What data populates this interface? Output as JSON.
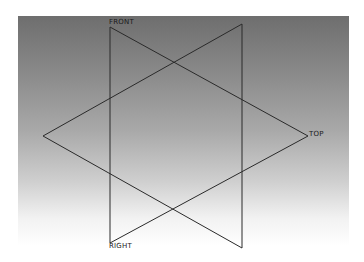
{
  "viewport": {
    "background_top": "#6e6e6e",
    "background_bottom": "#ffffff",
    "line_color": "#2a2a2a"
  },
  "datum_planes": [
    {
      "name": "FRONT",
      "label": "FRONT",
      "label_pos": [
        109,
        19
      ]
    },
    {
      "name": "TOP",
      "label": "TOP",
      "label_pos": [
        309,
        131
      ]
    },
    {
      "name": "RIGHT",
      "label": "RIGHT",
      "label_pos": [
        109,
        243
      ]
    }
  ],
  "lines": [
    {
      "x1": 110,
      "y1": 27,
      "x2": 110,
      "y2": 243
    },
    {
      "x1": 242,
      "y1": 24,
      "x2": 242,
      "y2": 248
    },
    {
      "x1": 110,
      "y1": 27,
      "x2": 308,
      "y2": 136
    },
    {
      "x1": 242,
      "y1": 24,
      "x2": 43,
      "y2": 136
    },
    {
      "x1": 43,
      "y1": 136,
      "x2": 242,
      "y2": 248
    },
    {
      "x1": 308,
      "y1": 136,
      "x2": 110,
      "y2": 243
    }
  ]
}
